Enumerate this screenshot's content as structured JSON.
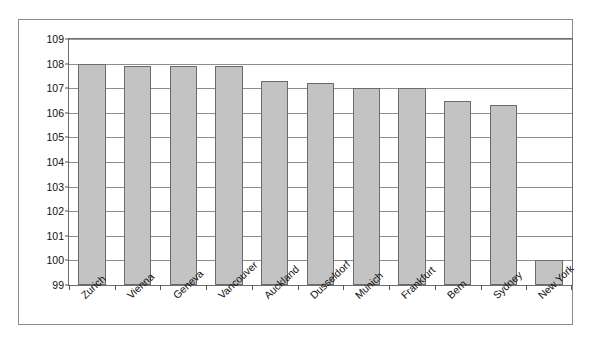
{
  "chart_data": {
    "type": "bar",
    "title": "",
    "subtitle": "",
    "xlabel": "",
    "ylabel": "",
    "categories": [
      "Zurich",
      "Vienna",
      "Geneva",
      "Vancouver",
      "Auckland",
      "Dusseldorf",
      "Munich",
      "Frankfurt",
      "Bern",
      "Sydney",
      "New York"
    ],
    "values": [
      108.0,
      107.9,
      107.9,
      107.9,
      107.3,
      107.2,
      107.0,
      107.0,
      106.5,
      106.3,
      100.0
    ],
    "series": [
      {
        "name": "",
        "values": [
          108.0,
          107.9,
          107.9,
          107.9,
          107.3,
          107.2,
          107.0,
          107.0,
          106.5,
          106.3,
          100.0
        ]
      }
    ],
    "ylim": [
      99,
      109
    ],
    "yticks": [
      99,
      100,
      101,
      102,
      103,
      104,
      105,
      106,
      107,
      108,
      109
    ],
    "ytick_labels": [
      "99",
      "100",
      "101",
      "102",
      "103",
      "104",
      "105",
      "106",
      "107",
      "108",
      "109"
    ],
    "grid": true,
    "grid_axis": "y",
    "legend": false,
    "legend_position": "none",
    "bar_color": "#c3c3c3",
    "bar_edge_color": "#6b6b6b",
    "gridline_color": "#8d8d8d",
    "frame_color": "#8a8a8a",
    "plot_border_color": "#6e6e6e",
    "background_color": "#ffffff",
    "xtick_label_rotation": -43
  }
}
